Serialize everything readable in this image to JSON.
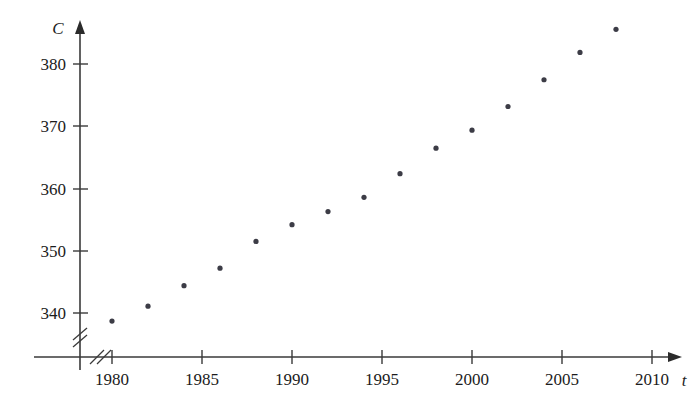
{
  "chart_data": {
    "type": "scatter",
    "title": "",
    "subtitle": "",
    "xlabel": "t",
    "ylabel": "C",
    "x": [
      1980,
      1982,
      1984,
      1986,
      1988,
      1990,
      1992,
      1994,
      1996,
      1998,
      2000,
      2002,
      2004,
      2006,
      2008
    ],
    "values": [
      338.7,
      341.1,
      344.4,
      347.2,
      351.5,
      354.2,
      356.3,
      358.6,
      362.4,
      366.5,
      369.4,
      373.2,
      377.5,
      381.9,
      385.6
    ],
    "series": [
      {
        "name": "C",
        "values": [
          338.7,
          341.1,
          344.4,
          347.2,
          351.5,
          354.2,
          356.3,
          358.6,
          362.4,
          366.5,
          369.4,
          373.2,
          377.5,
          381.9,
          385.6
        ]
      }
    ],
    "xlim": [
      1978,
      2011
    ],
    "ylim": [
      336,
      388
    ],
    "x_ticks": [
      1980,
      1985,
      1990,
      1995,
      2000,
      2005,
      2010
    ],
    "x_tick_labels": [
      "1980",
      "1985",
      "1990",
      "1995",
      "2000",
      "2005",
      "2010"
    ],
    "y_ticks": [
      340,
      350,
      360,
      370,
      380
    ],
    "y_tick_labels": [
      "340",
      "350",
      "360",
      "370",
      "380"
    ],
    "grid": false,
    "legend": null,
    "axis_break_x": true,
    "axis_break_y": true,
    "marker": "filled-circle",
    "marker_color": "#3c3c46",
    "axis_color": "#3a3a3a"
  },
  "axes": {
    "y_axis_label": "C",
    "x_axis_label": "t"
  },
  "ghost": {
    "line1": "",
    "line2": ""
  }
}
